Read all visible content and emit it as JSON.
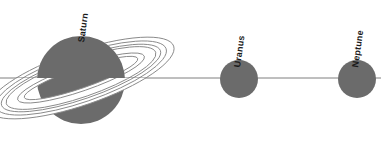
{
  "figure": {
    "title": "",
    "background_color": "#ffffff",
    "width": 381,
    "height": 153
  },
  "style": {
    "planet_fill": "#6b6b6b",
    "planet_stroke": "none",
    "ring_stroke": "#8a8a8a",
    "ring_fill": "#ffffff",
    "axis_line_color": "#6f6f6f",
    "label_color": "#1a1a1a"
  },
  "axis_line": {
    "name": "orbital-plane-line",
    "x1": 0,
    "y1": 78,
    "x2": 381,
    "y2": 78
  },
  "planets": [
    {
      "name": "Saturn",
      "label": "Saturn",
      "cx": 81,
      "cy": 80,
      "r": 44,
      "has_rings": true,
      "label_x": 86,
      "label_y": 34,
      "label_rotation": -82
    },
    {
      "name": "Uranus",
      "label": "Uranus",
      "cx": 239,
      "cy": 79,
      "r": 19,
      "has_rings": false,
      "label_x": 242,
      "label_y": 59,
      "label_rotation": -82
    },
    {
      "name": "Neptune",
      "label": "Neptune",
      "cx": 357,
      "cy": 79,
      "r": 19,
      "has_rings": false,
      "label_x": 360,
      "label_y": 59,
      "label_rotation": -82
    }
  ],
  "saturn_rings": {
    "name": "saturn-ring-system",
    "center_x": 81,
    "center_y": 78,
    "tilt_degrees": -19,
    "bands": [
      {
        "name": "outer-a-ring-outer-edge",
        "rx": 98,
        "ry": 27
      },
      {
        "name": "outer-a-ring-inner-edge",
        "rx": 90,
        "ry": 24
      },
      {
        "name": "cassini-division-outer",
        "rx": 84,
        "ry": 21
      },
      {
        "name": "b-ring-outer-edge",
        "rx": 79,
        "ry": 19
      },
      {
        "name": "b-ring-inner-edge",
        "rx": 67,
        "ry": 13
      },
      {
        "name": "c-ring-inner-edge",
        "rx": 60,
        "ry": 10
      }
    ]
  }
}
